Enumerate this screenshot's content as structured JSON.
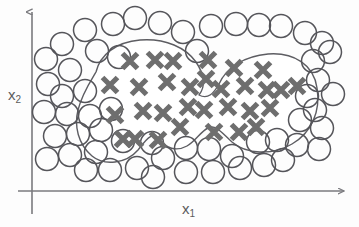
{
  "chart_data": {
    "type": "scatter",
    "title": "",
    "subtitle": "",
    "xlabel": "x",
    "xlabel_sub": "1",
    "ylabel": "x",
    "ylabel_sub": "2",
    "grid": false,
    "legend_position": "none",
    "axis_style": "arrow",
    "xlim": [
      0,
      359
    ],
    "ylim": [
      0,
      227
    ],
    "annotations": [
      {
        "name": "decision-boundary",
        "kind": "closed-curve",
        "description": "peanut-shaped nonlinear decision boundary enclosing the cross class"
      }
    ],
    "colors": {
      "cross_marker": "#6e6e6e",
      "circle_stroke": "#55555a",
      "axis": "#7a7a7e",
      "boundary": "#5d5d62",
      "background": "#fdfdfd",
      "label_text": "#5b5b5b"
    },
    "series": [
      {
        "name": "class-cross",
        "marker": "x",
        "color": "#6e6e6e",
        "count": 31,
        "points": [
          [
            130,
            61
          ],
          [
            155,
            60
          ],
          [
            110,
            85
          ],
          [
            139,
            87
          ],
          [
            167,
            82
          ],
          [
            190,
            87
          ],
          [
            206,
            79
          ],
          [
            115,
            115
          ],
          [
            143,
            111
          ],
          [
            163,
            113
          ],
          [
            188,
            107
          ],
          [
            180,
            127
          ],
          [
            135,
            139
          ],
          [
            158,
            140
          ],
          [
            234,
            68
          ],
          [
            263,
            70
          ],
          [
            221,
            89
          ],
          [
            245,
            86
          ],
          [
            281,
            90
          ],
          [
            204,
            110
          ],
          [
            228,
            107
          ],
          [
            250,
            111
          ],
          [
            270,
            108
          ],
          [
            239,
            132
          ],
          [
            256,
            127
          ],
          [
            214,
            132
          ],
          [
            297,
            86
          ],
          [
            267,
            90
          ],
          [
            208,
            60
          ],
          [
            173,
            61
          ],
          [
            123,
            139
          ]
        ]
      },
      {
        "name": "class-circle",
        "marker": "o",
        "color": "#55555a",
        "count": 57,
        "points": [
          [
            62,
            44
          ],
          [
            85,
            30
          ],
          [
            113,
            24
          ],
          [
            135,
            18
          ],
          [
            160,
            23
          ],
          [
            183,
            32
          ],
          [
            211,
            26
          ],
          [
            236,
            24
          ],
          [
            259,
            25
          ],
          [
            281,
            26
          ],
          [
            305,
            33
          ],
          [
            322,
            43
          ],
          [
            46,
            59
          ],
          [
            70,
            70
          ],
          [
            97,
            51
          ],
          [
            119,
            57
          ],
          [
            197,
            51
          ],
          [
            48,
            84
          ],
          [
            62,
            96
          ],
          [
            85,
            91
          ],
          [
            313,
            61
          ],
          [
            330,
            52
          ],
          [
            318,
            80
          ],
          [
            307,
            96
          ],
          [
            44,
            112
          ],
          [
            67,
            114
          ],
          [
            90,
            116
          ],
          [
            111,
            109
          ],
          [
            315,
            110
          ],
          [
            333,
            94
          ],
          [
            55,
            136
          ],
          [
            78,
            134
          ],
          [
            101,
            130
          ],
          [
            300,
            120
          ],
          [
            322,
            128
          ],
          [
            70,
            155
          ],
          [
            96,
            152
          ],
          [
            123,
            141
          ],
          [
            152,
            143
          ],
          [
            297,
            145
          ],
          [
            319,
            149
          ],
          [
            110,
            170
          ],
          [
            137,
            168
          ],
          [
            163,
            158
          ],
          [
            186,
            148
          ],
          [
            209,
            149
          ],
          [
            232,
            156
          ],
          [
            258,
            142
          ],
          [
            277,
            140
          ],
          [
            186,
            172
          ],
          [
            213,
            172
          ],
          [
            240,
            168
          ],
          [
            264,
            165
          ],
          [
            283,
            160
          ],
          [
            47,
            159
          ],
          [
            86,
            170
          ],
          [
            153,
            177
          ]
        ]
      }
    ]
  },
  "geometry": {
    "y_axis": {
      "x": 32,
      "y_top": 9,
      "y_bottom": 214
    },
    "x_axis": {
      "y": 191,
      "x_left": 18,
      "x_right": 348
    },
    "circle_radius": 11.5,
    "cross_size": 15,
    "boundary_path": "M 96 72 C 100 55, 116 42, 140 40 C 166 38, 186 48, 196 62 C 204 74, 206 86, 199 95 C 208 100, 214 93, 219 84 C 226 68, 244 56, 268 54 C 294 52, 314 65, 317 88 C 321 112, 311 133, 292 144 C 272 156, 246 154, 232 142 C 222 133, 216 124, 208 128 C 200 132, 196 141, 187 146 C 176 152, 166 148, 160 140 C 152 130, 146 140, 138 150 C 126 164, 104 166, 92 156 C 78 144, 74 126, 78 110 C 82 94, 90 82, 96 72 Z"
  }
}
